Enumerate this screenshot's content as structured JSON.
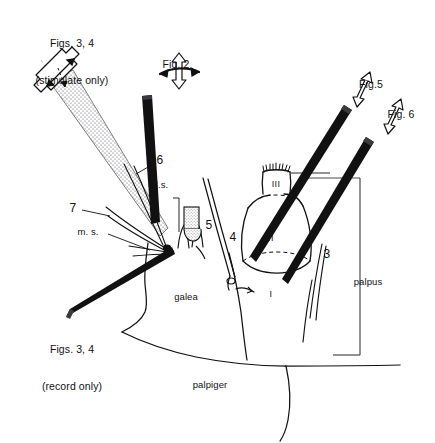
{
  "figure": {
    "type": "anatomical-line-diagram",
    "background_color": "#ffffff",
    "line_color": "#111111",
    "electrode_color": "#111111",
    "stipple_color": "#b9b9bd",
    "top_cropped_text": "",
    "callouts": [
      {
        "id": "stimulate",
        "line1": "Figs. 3, 4",
        "line2": "(stimulate only)",
        "x": 72,
        "y": 16
      },
      {
        "id": "fig2",
        "line1": "Fig. 2",
        "line2": "",
        "x": 176,
        "y": 38
      },
      {
        "id": "fig5",
        "line1": "Fig.5",
        "line2": "",
        "x": 371,
        "y": 58
      },
      {
        "id": "fig6",
        "line1": "Fig. 6",
        "line2": "",
        "x": 401,
        "y": 88
      },
      {
        "id": "record",
        "line1": "Figs. 3, 4",
        "line2": "(record only)",
        "x": 72,
        "y": 322
      }
    ],
    "labels": [
      {
        "id": "sensillum-6",
        "text": "6",
        "x": 160,
        "y": 160,
        "kind": "num"
      },
      {
        "id": "sensillum-7",
        "text": "7",
        "x": 73,
        "y": 208,
        "kind": "num"
      },
      {
        "id": "lateral-sensillum",
        "text": "l.s.",
        "x": 160,
        "y": 185,
        "kind": "anat"
      },
      {
        "id": "medial-sensillum",
        "text": "m. s.",
        "x": 88,
        "y": 232,
        "kind": "anat"
      },
      {
        "id": "sensillum-5",
        "text": "5",
        "x": 209,
        "y": 225,
        "kind": "num"
      },
      {
        "id": "sensillum-4",
        "text": "4",
        "x": 233,
        "y": 237,
        "kind": "num"
      },
      {
        "id": "sensillum-3",
        "text": "3",
        "x": 327,
        "y": 254,
        "kind": "num"
      },
      {
        "id": "palp-segment-3",
        "text": "III",
        "x": 276,
        "y": 184,
        "kind": "rom"
      },
      {
        "id": "palp-segment-2",
        "text": "II",
        "x": 271,
        "y": 238,
        "kind": "rom"
      },
      {
        "id": "palp-segment-1",
        "text": "I",
        "x": 271,
        "y": 294,
        "kind": "rom"
      },
      {
        "id": "galea",
        "text": "galea",
        "x": 186,
        "y": 297,
        "kind": "anat"
      },
      {
        "id": "palpus",
        "text": "palpus",
        "x": 368,
        "y": 282,
        "kind": "anat"
      },
      {
        "id": "palpiger",
        "text": "palpiger",
        "x": 210,
        "y": 385,
        "kind": "anat"
      }
    ]
  }
}
